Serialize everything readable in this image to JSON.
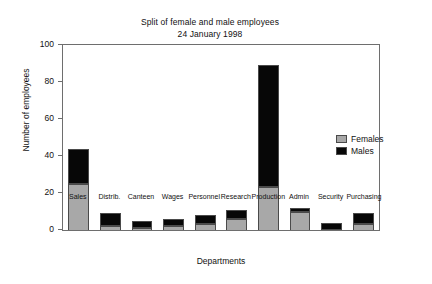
{
  "chart_data": {
    "type": "bar",
    "stacked": true,
    "title": "Split of female and male employees",
    "subtitle": "24 January 1998",
    "xlabel": "Departments",
    "ylabel": "Number of employees",
    "ylim": [
      0,
      100
    ],
    "yticks": [
      0,
      20,
      40,
      60,
      80,
      100
    ],
    "grid": false,
    "legend_position": "right",
    "categories": [
      "Sales",
      "Distrib.",
      "Canteen",
      "Wages",
      "Personnel",
      "Research",
      "Production",
      "Admin",
      "Security",
      "Purchasing"
    ],
    "series": [
      {
        "name": "Females",
        "color": "#a8a8a8",
        "values": [
          25,
          2,
          1,
          2,
          3,
          6,
          23,
          10,
          0,
          3
        ]
      },
      {
        "name": "Males",
        "color": "#070707",
        "values": [
          19,
          7,
          4,
          4,
          5,
          5,
          66,
          2,
          4,
          6
        ]
      }
    ],
    "totals": [
      44,
      9,
      5,
      6,
      8,
      11,
      89,
      12,
      4,
      9
    ]
  },
  "legend": {
    "entries": [
      {
        "label": "Females"
      },
      {
        "label": "Males"
      }
    ]
  }
}
